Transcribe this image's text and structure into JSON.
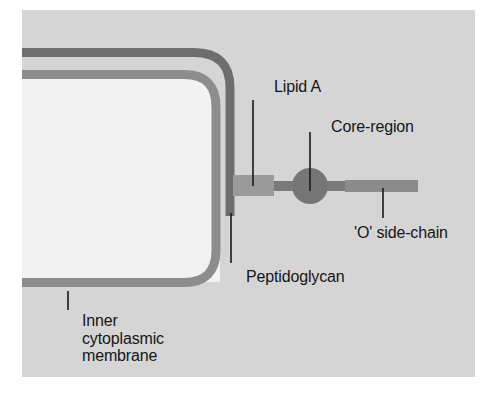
{
  "figure": {
    "type": "diagram",
    "background_color": "#ffffff",
    "panel_color": "#d5d5d5"
  },
  "labels": {
    "lipid_a": "Lipid A",
    "core_region": "Core-region",
    "o_side_chain": "'O' side-chain",
    "peptidoglycan": "Peptidoglycan",
    "inner_cytoplasmic_membrane": "Inner\ncytoplasmic\nmembrane"
  },
  "colors": {
    "outer_membrane_line": "#6e6e6e",
    "inner_membrane_line": "#8d8d8d",
    "cytoplasm_fill": "#f2f2f2",
    "lipid_a_block": "#9a9a9a",
    "core_region_circle": "#767676",
    "o_side_chain_bar": "#8b8b8b",
    "connector_stalk": "#7a7a7a",
    "leader_line": "#1a1a1a",
    "text": "#161616"
  },
  "structures": {
    "outer_membrane": {
      "name": "outer-membrane-line",
      "stroke_width": 9,
      "description": "dark grey rounded line running across top and down the right side"
    },
    "inner_membrane": {
      "name": "inner-cytoplasmic-membrane-line",
      "stroke_width": 9,
      "description": "lighter grey rounded line inside the outer membrane, enclosing the cytoplasm"
    },
    "lipid_a_block": {
      "name": "lipid-a-block",
      "x": 211,
      "y": 165,
      "width": 41,
      "height": 21
    },
    "core_region_circle": {
      "name": "core-region-circle",
      "cx": 288,
      "cy": 176,
      "r": 18
    },
    "o_side_chain_bar": {
      "name": "o-side-chain-bar",
      "x": 323,
      "y": 170,
      "width": 73,
      "height": 12
    }
  },
  "leader_lines": [
    {
      "name": "leader-lipid-a",
      "x1": 231,
      "y1": 90,
      "x2": 231,
      "y2": 176
    },
    {
      "name": "leader-core-region",
      "x1": 288,
      "y1": 122,
      "x2": 288,
      "y2": 180
    },
    {
      "name": "leader-o-side-chain",
      "x1": 361,
      "y1": 178,
      "x2": 361,
      "y2": 208
    },
    {
      "name": "leader-peptidoglycan",
      "x1": 209,
      "y1": 203,
      "x2": 209,
      "y2": 253
    },
    {
      "name": "leader-inner-membrane",
      "x1": 46,
      "y1": 281,
      "x2": 46,
      "y2": 300
    }
  ]
}
